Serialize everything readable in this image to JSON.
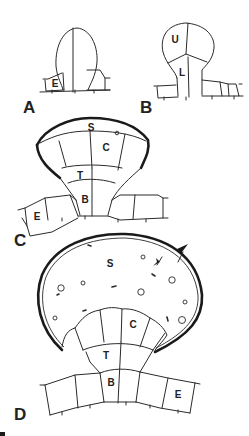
{
  "figure": {
    "panels": [
      {
        "id": "A",
        "label": "A",
        "cells": [
          {
            "label": "E"
          }
        ]
      },
      {
        "id": "B",
        "label": "B",
        "cells": [
          {
            "label": "U"
          },
          {
            "label": "L"
          }
        ]
      },
      {
        "id": "C",
        "label": "C",
        "cells": [
          {
            "label": "S"
          },
          {
            "label": "C"
          },
          {
            "label": "T"
          },
          {
            "label": "B"
          },
          {
            "label": "E"
          }
        ]
      },
      {
        "id": "D",
        "label": "D",
        "cells": [
          {
            "label": "S"
          },
          {
            "label": "C"
          },
          {
            "label": "T"
          },
          {
            "label": "B"
          },
          {
            "label": "E"
          }
        ]
      }
    ],
    "colors": {
      "ink": "#2a2a2a",
      "background": "#ffffff"
    }
  }
}
